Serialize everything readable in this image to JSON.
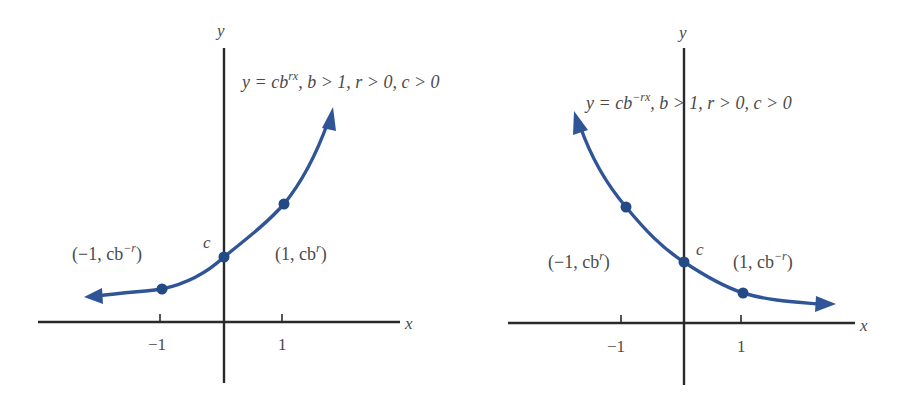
{
  "colors": {
    "curve": "#2f5597",
    "axis": "#2a2a2a",
    "text": "#4a4a4a"
  },
  "graphs": [
    {
      "id": "growth",
      "axis_labels": {
        "x": "x",
        "y": "y"
      },
      "ticks": [
        "−1",
        "1"
      ],
      "equation": {
        "lhs": "y = cb",
        "exponent": "rx",
        "conditions": ", b > 1, r > 0, c > 0"
      },
      "intercept_label": "c",
      "points": [
        {
          "label_prefix": "(−1, cb",
          "label_exp": "−r",
          "label_suffix": ")",
          "x": -1
        },
        {
          "label_prefix": "(1, cb",
          "label_exp": "r",
          "label_suffix": ")",
          "x": 1
        }
      ]
    },
    {
      "id": "decay",
      "axis_labels": {
        "x": "x",
        "y": "y"
      },
      "ticks": [
        "−1",
        "1"
      ],
      "equation": {
        "lhs": "y = cb",
        "exponent": "−rx",
        "conditions": ", b > 1, r > 0, c > 0"
      },
      "intercept_label": "c",
      "points": [
        {
          "label_prefix": "(−1, cb",
          "label_exp": "r",
          "label_suffix": ")",
          "x": -1
        },
        {
          "label_prefix": "(1, cb",
          "label_exp": "−r",
          "label_suffix": ")",
          "x": 1
        }
      ]
    }
  ]
}
